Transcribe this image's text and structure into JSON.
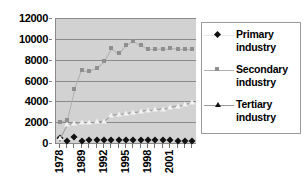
{
  "chart_data": {
    "type": "line",
    "title": "",
    "xlabel": "",
    "ylabel": "",
    "ylim": [
      0,
      12000
    ],
    "y_ticks": [
      0,
      2000,
      4000,
      6000,
      8000,
      10000,
      12000
    ],
    "y_tick_labels": [
      "0",
      "2000",
      "4000",
      "6000",
      "8000",
      "10000",
      "12000"
    ],
    "grid": true,
    "legend_position": "right",
    "x_tick_labels": [
      "1978",
      "1989",
      "1992",
      "1995",
      "1998",
      "2001"
    ],
    "x_tick_indices": [
      0,
      3,
      6,
      9,
      12,
      15
    ],
    "categories": [
      "1978",
      "1985",
      "1987",
      "1989",
      "1990",
      "1991",
      "1992",
      "1993",
      "1994",
      "1995",
      "1996",
      "1997",
      "1998",
      "1999",
      "2000",
      "2001",
      "2002",
      "2003",
      "2004"
    ],
    "series": [
      {
        "name": "Primary industry",
        "marker": "diamond",
        "color": "#111111",
        "line_color": "#e8e8e8",
        "values": [
          480,
          200,
          560,
          240,
          250,
          250,
          260,
          250,
          250,
          250,
          260,
          250,
          250,
          250,
          250,
          250,
          240,
          230,
          230
        ]
      },
      {
        "name": "Secondary industry",
        "marker": "square",
        "color": "#8f8f8f",
        "line_color": "#b0b0b0",
        "values": [
          1980,
          2200,
          5150,
          7050,
          6900,
          7200,
          7900,
          9100,
          8600,
          9400,
          9800,
          9400,
          9000,
          9000,
          9050,
          9100,
          9050,
          9050,
          9050
        ]
      },
      {
        "name": "Tertiary industry",
        "marker": "triangle",
        "color": "#f2f2f2",
        "line_color": "#9a9a9a",
        "values": [
          480,
          1850,
          1950,
          2050,
          2050,
          2080,
          2100,
          2700,
          2820,
          2900,
          3000,
          3050,
          3200,
          3250,
          3300,
          3450,
          3600,
          3750,
          3900
        ]
      }
    ]
  },
  "legend": {
    "entries": [
      {
        "label_line1": "Primary",
        "label_line2": "industry"
      },
      {
        "label_line1": "Secondary",
        "label_line2": "industry"
      },
      {
        "label_line1": "Tertiary",
        "label_line2": "industry"
      }
    ]
  },
  "colors": {
    "plot_background": "#d2d2d2",
    "gridline": "#8a8a8a",
    "axis": "#8a8a8a",
    "legend_border": "#9a9a9a",
    "page_background": "#ffffff",
    "text": "#000000"
  }
}
